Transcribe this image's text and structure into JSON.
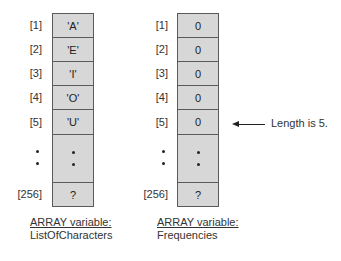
{
  "diagram": {
    "left_array": {
      "indices": [
        "[1]",
        "[2]",
        "[3]",
        "[4]",
        "[5]",
        "[256]"
      ],
      "values": [
        "'A'",
        "'E'",
        "'I'",
        "'O'",
        "'U'",
        "?"
      ],
      "ellipsis": "•\n•",
      "caption_heading": "ARRAY variable:",
      "caption_name": "ListOfCharacters"
    },
    "right_array": {
      "indices": [
        "[1]",
        "[2]",
        "[3]",
        "[4]",
        "[5]",
        "[256]"
      ],
      "values": [
        "0",
        "0",
        "0",
        "0",
        "0",
        "?"
      ],
      "caption_heading": "ARRAY variable:",
      "caption_name": "Frequencies"
    },
    "annotation": {
      "text": "Length is 5.",
      "points_to": "right_array[5]"
    },
    "colors": {
      "cell_fill": "#d7d7d7",
      "cell_border": "#5a5a5a",
      "text": "#222222"
    }
  }
}
